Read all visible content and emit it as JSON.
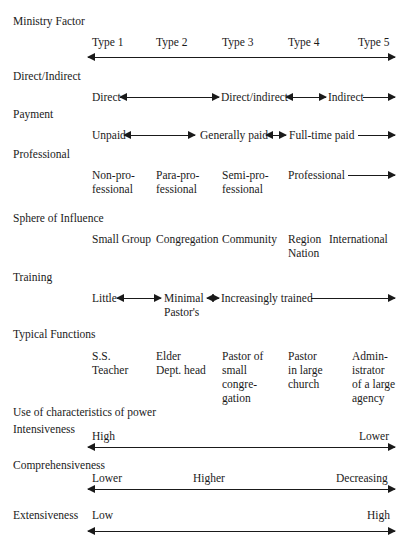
{
  "ministry_factor": {
    "label": "Ministry Factor",
    "types": [
      "Type 1",
      "Type 2",
      "Type 3",
      "Type 4",
      "Type 5"
    ]
  },
  "direct_indirect": {
    "label": "Direct/Indirect",
    "values": [
      "Direct",
      "Direct/indirect",
      "Indirect"
    ]
  },
  "payment": {
    "label": "Payment",
    "values": [
      "Unpaid",
      "Generally paid",
      "Full-time paid"
    ]
  },
  "professional": {
    "label": "Professional",
    "values": [
      "Non-pro-\nfessional",
      "Para-pro-\nfessional",
      "Semi-pro-\nfessional",
      "Professional"
    ]
  },
  "sphere_of_influence": {
    "label": "Sphere of Influence",
    "values": [
      "Small Group",
      "Congregation",
      "Community",
      "Region\nNation",
      "International"
    ]
  },
  "training": {
    "label": "Training",
    "values": [
      "Little",
      "Minimal\nPastor's",
      "Increasingly trained"
    ]
  },
  "typical_functions": {
    "label": "Typical Functions",
    "values": [
      "S.S.\nTeacher",
      "Elder\nDept. head",
      "Pastor of\nsmall\ncongre-\ngation",
      "Pastor\nin large\nchurch",
      "Admin-\nistrator\nof a large\nagency"
    ]
  },
  "power": {
    "label": "Use of characteristics of power",
    "intensiveness": {
      "label": "Intensiveness",
      "values": [
        "High",
        "Lower"
      ]
    },
    "comprehensiveness": {
      "label": "Comprehensiveness",
      "values": [
        "Lower",
        "Higher",
        "Decreasing"
      ]
    },
    "extensiveness": {
      "label": "Extensiveness",
      "values": [
        "Low",
        "High"
      ]
    }
  }
}
